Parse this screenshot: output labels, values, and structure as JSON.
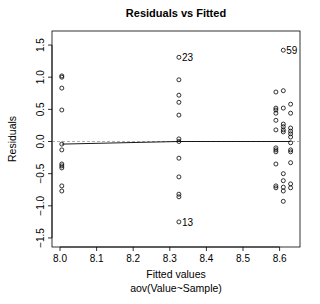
{
  "chart_data": {
    "type": "scatter",
    "title": "Residuals vs Fitted",
    "xlabel": "Fitted values",
    "sublabel": "aov(Value~Sample)",
    "ylabel": "Residuals",
    "xlim": [
      7.98,
      8.66
    ],
    "ylim": [
      -1.65,
      1.72
    ],
    "xticks": [
      8.0,
      8.1,
      8.2,
      8.3,
      8.4,
      8.5,
      8.6
    ],
    "xtick_labels": [
      "8.0",
      "8.1",
      "8.2",
      "8.3",
      "8.4",
      "8.5",
      "8.6"
    ],
    "yticks": [
      -1.5,
      -1.0,
      -0.5,
      0.0,
      0.5,
      1.0,
      1.5
    ],
    "ytick_labels": [
      "-1.5",
      "-1.0",
      "-0.5",
      "0.0",
      "0.5",
      "1.0",
      "1.5"
    ],
    "grid": false,
    "reference_line": {
      "y": 0,
      "style": "dashed",
      "color": "#999999"
    },
    "smoother": {
      "style": "solid",
      "color": "#000000",
      "points": [
        [
          8.005,
          -0.04
        ],
        [
          8.325,
          0.0
        ],
        [
          8.63,
          0.0
        ]
      ]
    },
    "series": [
      {
        "name": "residuals",
        "points": [
          [
            8.005,
            1.02
          ],
          [
            8.005,
            1.0
          ],
          [
            8.005,
            0.83
          ],
          [
            8.005,
            0.49
          ],
          [
            8.005,
            -0.04
          ],
          [
            8.005,
            -0.13
          ],
          [
            8.005,
            -0.35
          ],
          [
            8.005,
            -0.38
          ],
          [
            8.005,
            -0.41
          ],
          [
            8.005,
            -0.69
          ],
          [
            8.005,
            -0.77
          ],
          [
            8.325,
            1.31
          ],
          [
            8.325,
            0.96
          ],
          [
            8.325,
            0.72
          ],
          [
            8.325,
            0.61
          ],
          [
            8.325,
            0.41
          ],
          [
            8.325,
            0.04
          ],
          [
            8.325,
            0.0
          ],
          [
            8.325,
            -0.26
          ],
          [
            8.325,
            -0.55
          ],
          [
            8.325,
            -0.82
          ],
          [
            8.325,
            -0.86
          ],
          [
            8.325,
            -1.25
          ],
          [
            8.59,
            0.77
          ],
          [
            8.59,
            0.52
          ],
          [
            8.59,
            0.49
          ],
          [
            8.59,
            0.44
          ],
          [
            8.59,
            0.33
          ],
          [
            8.59,
            0.18
          ],
          [
            8.59,
            -0.1
          ],
          [
            8.59,
            -0.13
          ],
          [
            8.59,
            -0.16
          ],
          [
            8.59,
            -0.35
          ],
          [
            8.59,
            -0.69
          ],
          [
            8.59,
            -0.72
          ],
          [
            8.61,
            1.42
          ],
          [
            8.61,
            0.79
          ],
          [
            8.61,
            0.52
          ],
          [
            8.61,
            0.27
          ],
          [
            8.61,
            0.23
          ],
          [
            8.61,
            0.18
          ],
          [
            8.61,
            0.15
          ],
          [
            8.61,
            -0.5
          ],
          [
            8.61,
            -0.61
          ],
          [
            8.61,
            -0.71
          ],
          [
            8.61,
            -0.77
          ],
          [
            8.61,
            -0.93
          ],
          [
            8.63,
            0.58
          ],
          [
            8.63,
            0.44
          ],
          [
            8.63,
            0.21
          ],
          [
            8.63,
            0.16
          ],
          [
            8.63,
            0.12
          ],
          [
            8.63,
            0.07
          ],
          [
            8.63,
            -0.02
          ],
          [
            8.63,
            -0.13
          ],
          [
            8.63,
            -0.16
          ],
          [
            8.63,
            -0.33
          ],
          [
            8.63,
            -0.66
          ],
          [
            8.63,
            -0.72
          ]
        ]
      }
    ],
    "annotations": [
      {
        "text": "59",
        "x": 8.61,
        "y": 1.42
      },
      {
        "text": "23",
        "x": 8.325,
        "y": 1.31
      },
      {
        "text": "13",
        "x": 8.325,
        "y": -1.25
      }
    ]
  },
  "layout": {
    "plot_box": {
      "left": 52,
      "top": 31,
      "right": 300,
      "bottom": 247
    },
    "x_map": {
      "v0": 8.0,
      "px0": 60,
      "px_per_unit": 366
    },
    "y_map": {
      "v0": 0.0,
      "px0": 141.5,
      "px_per_unit": 64.3
    }
  }
}
